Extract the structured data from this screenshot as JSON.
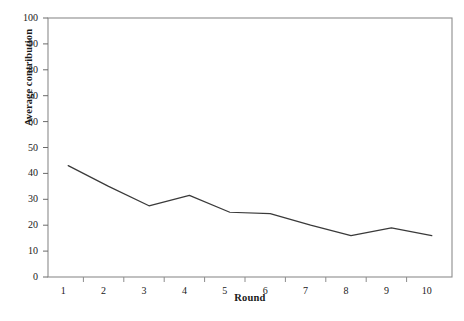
{
  "chart_data": {
    "type": "line",
    "title": "",
    "xlabel": "Round",
    "ylabel": "Average contribution",
    "categories": [
      1,
      2,
      3,
      4,
      5,
      6,
      7,
      8,
      9,
      10
    ],
    "x": [
      1,
      2,
      3,
      4,
      5,
      6,
      7,
      8,
      9,
      10
    ],
    "values": [
      43,
      35,
      27.5,
      31.5,
      25,
      24.5,
      20,
      16,
      19,
      16
    ],
    "series": [
      {
        "name": "Average contribution",
        "values": [
          43,
          35,
          27.5,
          31.5,
          25,
          24.5,
          20,
          16,
          19,
          16
        ]
      }
    ],
    "xlim": [
      0.5,
      10.5
    ],
    "ylim": [
      0,
      100
    ],
    "ytick_labels": [
      "0",
      "10",
      "20",
      "30",
      "40",
      "50",
      "60",
      "70",
      "80",
      "90",
      "100"
    ],
    "ytick_values": [
      0,
      10,
      20,
      30,
      40,
      50,
      60,
      70,
      80,
      90,
      100
    ],
    "xtick_labels": [
      "1",
      "2",
      "3",
      "4",
      "5",
      "6",
      "7",
      "8",
      "9",
      "10"
    ],
    "grid": false,
    "legend": false,
    "line_color": "#3a3a3a",
    "frame_color": "#8c8c8c",
    "background": "#ffffff"
  }
}
